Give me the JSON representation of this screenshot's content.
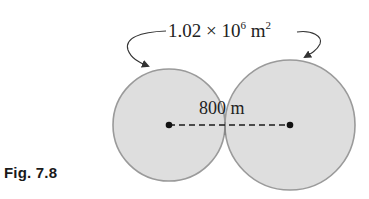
{
  "figure": {
    "caption": "Fig. 7.8",
    "area_label": {
      "coefficient": "1.02 × 10",
      "exponent": "6",
      "unit": " m",
      "unit_exponent": "2"
    },
    "distance_label": "800 m",
    "circles": [
      {
        "name": "left-circle",
        "cx": 169,
        "cy": 125,
        "r": 56
      },
      {
        "name": "right-circle",
        "cx": 290,
        "cy": 125,
        "r": 65
      }
    ],
    "colors": {
      "fill": "#dedede",
      "outline": "#9a9a9a",
      "line": "#1a1a1a",
      "text": "#222222"
    }
  }
}
